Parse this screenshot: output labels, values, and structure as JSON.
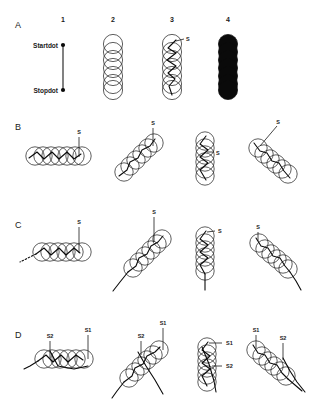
{
  "figure": {
    "background_color": "#ffffff",
    "ink_color": "#0a0a0a",
    "width": 312,
    "height": 406
  },
  "column_headers": [
    {
      "label": "1",
      "x": 63,
      "y": 22
    },
    {
      "label": "2",
      "x": 113,
      "y": 22
    },
    {
      "label": "3",
      "x": 172,
      "y": 22
    },
    {
      "label": "4",
      "x": 228,
      "y": 22
    }
  ],
  "row_letters": [
    {
      "label": "A",
      "x": 15,
      "y": 28
    },
    {
      "label": "B",
      "x": 15,
      "y": 130
    },
    {
      "label": "C",
      "x": 15,
      "y": 228
    },
    {
      "label": "D",
      "x": 15,
      "y": 338
    }
  ],
  "axis_labels": {
    "startdot": "Startdot",
    "stopdot": "Stopdot",
    "startdot_pos": {
      "x": 22,
      "y": 48
    },
    "stopdot_pos": {
      "x": 25,
      "y": 93
    },
    "line_x": 63,
    "line_top": 45,
    "line_bottom": 90
  },
  "stroke_labels": {
    "s": "S",
    "s1": "S1",
    "s2": "S2"
  },
  "panel_a": {
    "col3_label": {
      "text": "S",
      "x": 186,
      "y": 41
    },
    "circle_count": 7,
    "circle_radius": 9.5,
    "filled_column_index": 4
  },
  "panel_b": {
    "orientations": [
      "horizontal",
      "diagonal-up",
      "vertical",
      "diagonal-down"
    ],
    "labels": [
      {
        "text": "S",
        "x": 79,
        "y": 133
      },
      {
        "text": "S",
        "x": 152,
        "y": 124
      },
      {
        "text": "S",
        "x": 216,
        "y": 155
      },
      {
        "text": "S",
        "x": 278,
        "y": 122
      }
    ]
  },
  "panel_c": {
    "orientations": [
      "horizontal",
      "diagonal-up",
      "vertical",
      "diagonal-down"
    ],
    "labels": [
      {
        "text": "S",
        "x": 79,
        "y": 223
      },
      {
        "text": "S",
        "x": 153,
        "y": 213
      },
      {
        "text": "S",
        "x": 218,
        "y": 233
      },
      {
        "text": "S",
        "x": 258,
        "y": 228
      }
    ]
  },
  "panel_d": {
    "orientations": [
      "horizontal",
      "diagonal-up",
      "vertical",
      "diagonal-down"
    ],
    "labels": [
      {
        "text": "S2",
        "x": 49,
        "y": 337
      },
      {
        "text": "S1",
        "x": 88,
        "y": 331
      },
      {
        "text": "S2",
        "x": 140,
        "y": 337
      },
      {
        "text": "S1",
        "x": 163,
        "y": 324
      },
      {
        "text": "S1",
        "x": 226,
        "y": 344
      },
      {
        "text": "S2",
        "x": 226,
        "y": 368
      },
      {
        "text": "S1",
        "x": 256,
        "y": 331
      },
      {
        "text": "S2",
        "x": 283,
        "y": 339
      }
    ]
  }
}
